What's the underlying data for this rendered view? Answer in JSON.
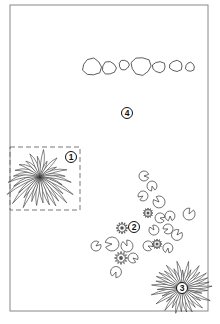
{
  "diagram": {
    "type": "garden-pond-planting-plan",
    "frame": {
      "x": 10,
      "y": 5,
      "width": 198,
      "height": 306,
      "stroke": "#888888"
    },
    "ink_color": "#333333",
    "labels": [
      {
        "id": "1",
        "text": "1",
        "x": 71,
        "y": 157,
        "refers_to": "grass-clump-in-dashed-box"
      },
      {
        "id": "2",
        "text": "2",
        "x": 134,
        "y": 227,
        "refers_to": "water-lilies"
      },
      {
        "id": "3",
        "text": "3",
        "x": 182,
        "y": 288,
        "refers_to": "grass-clump-corner"
      },
      {
        "id": "4",
        "text": "4",
        "x": 127,
        "y": 113,
        "refers_to": "pond-area"
      }
    ],
    "dashed_box": {
      "x": 10,
      "y": 147,
      "width": 70,
      "height": 63
    },
    "stones": [
      {
        "cx": 92,
        "cy": 67,
        "rx": 9.5,
        "ry": 8.5
      },
      {
        "cx": 109,
        "cy": 68,
        "rx": 7,
        "ry": 6.5
      },
      {
        "cx": 124,
        "cy": 65,
        "rx": 5,
        "ry": 5
      },
      {
        "cx": 141,
        "cy": 66,
        "rx": 10,
        "ry": 9
      },
      {
        "cx": 159,
        "cy": 67,
        "rx": 6.5,
        "ry": 5.5
      },
      {
        "cx": 176,
        "cy": 66,
        "rx": 6.5,
        "ry": 5.5
      },
      {
        "cx": 190,
        "cy": 67,
        "rx": 4.5,
        "ry": 4.5
      }
    ],
    "lily_pads": [
      {
        "cx": 144,
        "cy": 176,
        "r": 5
      },
      {
        "cx": 152,
        "cy": 186,
        "r": 5
      },
      {
        "cx": 143,
        "cy": 196,
        "r": 5
      },
      {
        "cx": 159,
        "cy": 202,
        "r": 6
      },
      {
        "cx": 189,
        "cy": 214,
        "r": 6
      },
      {
        "cx": 160,
        "cy": 218,
        "r": 5
      },
      {
        "cx": 170,
        "cy": 216,
        "r": 5
      },
      {
        "cx": 168,
        "cy": 229,
        "r": 5
      },
      {
        "cx": 154,
        "cy": 230,
        "r": 5
      },
      {
        "cx": 177,
        "cy": 235,
        "r": 5.5
      },
      {
        "cx": 148,
        "cy": 246,
        "r": 5
      },
      {
        "cx": 168,
        "cy": 248,
        "r": 5
      },
      {
        "cx": 112,
        "cy": 244,
        "r": 7
      },
      {
        "cx": 127,
        "cy": 246,
        "r": 6
      },
      {
        "cx": 96,
        "cy": 246,
        "r": 5
      },
      {
        "cx": 133,
        "cy": 258,
        "r": 5
      },
      {
        "cx": 116,
        "cy": 272,
        "r": 5.5
      }
    ],
    "lily_flowers": [
      {
        "cx": 122,
        "cy": 228,
        "r": 6
      },
      {
        "cx": 148,
        "cy": 213,
        "r": 5
      },
      {
        "cx": 157,
        "cy": 244,
        "r": 5
      },
      {
        "cx": 121,
        "cy": 258,
        "r": 6.5
      }
    ],
    "grass_clumps": [
      {
        "id": "grass-1",
        "cx": 40,
        "cy": 177,
        "r": 34,
        "blades": 30
      },
      {
        "id": "grass-3",
        "cx": 182,
        "cy": 288,
        "r": 32,
        "blades": 34
      }
    ]
  }
}
